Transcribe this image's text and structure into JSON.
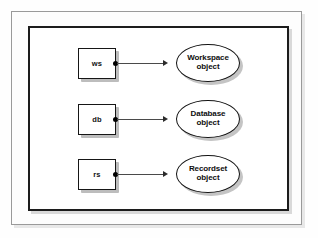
{
  "diagram": {
    "background_color": "#fefefe",
    "frame": {
      "outer_border_color": "#9a9a9a",
      "inner_border_color": "#1c1c1c"
    },
    "rows": [
      {
        "variable_label": "ws",
        "object_name": "Workspace",
        "object_suffix": "object",
        "connector": "arrow-right",
        "dot": "filled-dot"
      },
      {
        "variable_label": "db",
        "object_name": "Database",
        "object_suffix": "object",
        "connector": "arrow-right",
        "dot": "filled-dot"
      },
      {
        "variable_label": "rs",
        "object_name": "Recordset",
        "object_suffix": "object",
        "connector": "arrow-right",
        "dot": "filled-dot"
      }
    ]
  }
}
